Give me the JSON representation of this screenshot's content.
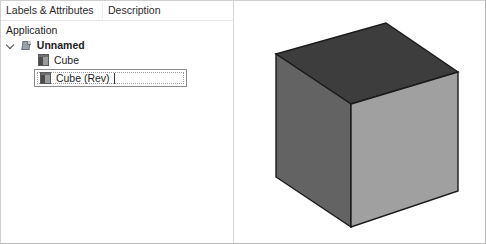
{
  "window": {
    "title": "Model Tree Viewer",
    "background_color": "#ffffff",
    "border_color": "#b9b9b9"
  },
  "tree_panel": {
    "columns": [
      {
        "id": "labels-attributes",
        "label": "Labels & Attributes"
      },
      {
        "id": "description",
        "label": "Description"
      }
    ],
    "rows": [
      {
        "id": "application",
        "label": "Application",
        "depth": 0,
        "icon": null,
        "expander": null,
        "bold": false,
        "selected": false
      },
      {
        "id": "unnamed",
        "label": "Unnamed",
        "depth": 1,
        "icon": "document-icon",
        "expander": "chevron-down-icon",
        "bold": true,
        "selected": false
      },
      {
        "id": "cube",
        "label": "Cube",
        "depth": 2,
        "icon": "cube-icon",
        "expander": null,
        "bold": false,
        "selected": false
      },
      {
        "id": "cube-rev",
        "label": "Cube (Rev)",
        "depth": 2,
        "icon": "cube-icon",
        "expander": null,
        "bold": false,
        "selected": true
      }
    ],
    "selection": {
      "row_id": "cube-rev",
      "border_color": "#8a8a8a",
      "focus_outline": "dotted",
      "editing": true
    }
  },
  "viewport": {
    "name": "3d-viewport",
    "background_color": "#ffffff",
    "divider_color": "#d7d7d7",
    "model": {
      "name": "cube",
      "projection": "isometric",
      "faces": [
        {
          "name": "top-face",
          "color": "#3d3d3d"
        },
        {
          "name": "left-face",
          "color": "#636363"
        },
        {
          "name": "right-face",
          "color": "#a0a0a0"
        }
      ],
      "edge_color": "#1a1a1a",
      "vertices": {
        "top_back": [
          385,
          22
        ],
        "top_left": [
          275,
          53
        ],
        "top_right": [
          457,
          71
        ],
        "front_center": [
          350,
          103
        ],
        "bottom_left": [
          275,
          176
        ],
        "bottom_front": [
          350,
          226
        ],
        "bottom_right": [
          457,
          190
        ]
      }
    }
  }
}
